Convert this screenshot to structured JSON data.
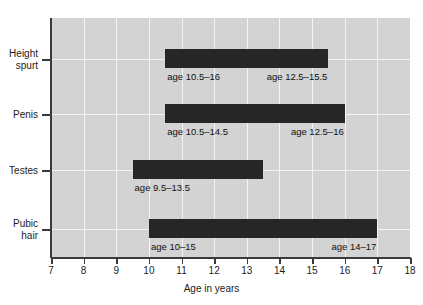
{
  "chart_data": {
    "type": "bar",
    "title": "",
    "subtitle": "",
    "xlabel": "Age in years",
    "ylabel": "",
    "xlim": [
      7,
      18
    ],
    "xticks": [
      7,
      8,
      9,
      10,
      11,
      12,
      13,
      14,
      15,
      16,
      17,
      18
    ],
    "xtick_labels": [
      "7",
      "8",
      "9",
      "10",
      "11",
      "12",
      "13",
      "14",
      "15",
      "16",
      "17",
      "18"
    ],
    "grid": true,
    "legend": "none",
    "orientation": "horizontal",
    "bar_color": "#262626",
    "plot_background": "#d3d3d3",
    "gridline_color": "#f4f4f4",
    "axis_color": "#3a3a3a",
    "categories": [
      "Height\nspurt",
      "Penis",
      "Testes",
      "Pubic\nhair"
    ],
    "series": [
      {
        "name": "Height spurt",
        "label": "Height\nspurt",
        "start": 10.5,
        "end": 15.5,
        "annotation_left": "age 10.5–16",
        "annotation_right": "age 12.5–15.5"
      },
      {
        "name": "Penis",
        "label": "Penis",
        "start": 10.5,
        "end": 16.0,
        "annotation_left": "age 10.5–14.5",
        "annotation_right": "age 12.5–16"
      },
      {
        "name": "Testes",
        "label": "Testes",
        "start": 9.5,
        "end": 13.5,
        "annotation_left": "age 9.5–13.5",
        "annotation_right": ""
      },
      {
        "name": "Pubic hair",
        "label": "Pubic\nhair",
        "start": 10.0,
        "end": 17.0,
        "annotation_left": "age 10–15",
        "annotation_right": "age 14–17"
      }
    ]
  }
}
